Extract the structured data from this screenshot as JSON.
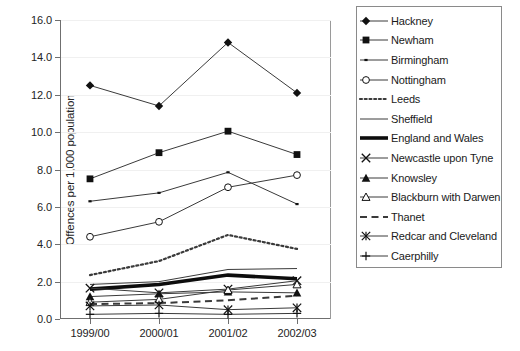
{
  "cut_title_fragment": "",
  "chart_data": {
    "type": "line",
    "title": "",
    "xlabel": "",
    "ylabel": "Offences per 1,000 population",
    "categories": [
      "1999/00",
      "2000/01",
      "2001/02",
      "2002/03"
    ],
    "ylim": [
      0,
      16
    ],
    "ytick_step": 2,
    "ytick_labels": [
      "0.0",
      "2.0",
      "4.0",
      "6.0",
      "8.0",
      "10.0",
      "12.0",
      "14.0",
      "16.0"
    ],
    "ytick_values": [
      0,
      2,
      4,
      6,
      8,
      10,
      12,
      14,
      16
    ],
    "grid": true,
    "legend_position": "right",
    "series": [
      {
        "name": "Hackney",
        "marker": "filled-diamond",
        "line": "solid",
        "width": 1,
        "values": [
          12.5,
          11.4,
          14.8,
          12.1
        ]
      },
      {
        "name": "Newham",
        "marker": "filled-square",
        "line": "solid",
        "width": 1,
        "values": [
          7.5,
          8.9,
          10.05,
          8.8
        ]
      },
      {
        "name": "Birmingham",
        "marker": "small-dot",
        "line": "solid",
        "width": 1,
        "values": [
          6.3,
          6.75,
          7.85,
          6.15
        ]
      },
      {
        "name": "Nottingham",
        "marker": "open-circle",
        "line": "solid",
        "width": 1,
        "values": [
          4.4,
          5.2,
          7.05,
          7.7
        ]
      },
      {
        "name": "Leeds",
        "marker": "none",
        "line": "dotted",
        "width": 2.2,
        "values": [
          2.35,
          3.1,
          4.5,
          3.75
        ]
      },
      {
        "name": "Sheffield",
        "marker": "none",
        "line": "solid",
        "width": 1,
        "values": [
          1.85,
          2.0,
          2.65,
          2.7
        ]
      },
      {
        "name": "England and Wales",
        "marker": "none",
        "line": "solid",
        "width": 3.6,
        "values": [
          1.6,
          1.85,
          2.35,
          2.15
        ]
      },
      {
        "name": "Newcastle upon Tyne",
        "marker": "cross-x",
        "line": "solid",
        "width": 1,
        "values": [
          1.65,
          1.4,
          1.6,
          2.05
        ]
      },
      {
        "name": "Knowsley",
        "marker": "filled-triangle",
        "line": "solid",
        "width": 1,
        "values": [
          1.2,
          1.35,
          1.45,
          1.4
        ]
      },
      {
        "name": "Blackburn with Darwen",
        "marker": "open-triangle",
        "line": "solid",
        "width": 1,
        "values": [
          0.9,
          1.05,
          1.55,
          1.85
        ]
      },
      {
        "name": "Thanet",
        "marker": "none",
        "line": "dashed",
        "width": 2,
        "values": [
          0.8,
          0.85,
          1.0,
          1.25
        ]
      },
      {
        "name": "Redcar and Cleveland",
        "marker": "star-x",
        "line": "solid",
        "width": 1,
        "values": [
          0.7,
          0.75,
          0.5,
          0.6
        ]
      },
      {
        "name": "Caerphilly",
        "marker": "plus",
        "line": "solid",
        "width": 1,
        "values": [
          0.25,
          0.3,
          0.25,
          0.3
        ]
      }
    ]
  }
}
